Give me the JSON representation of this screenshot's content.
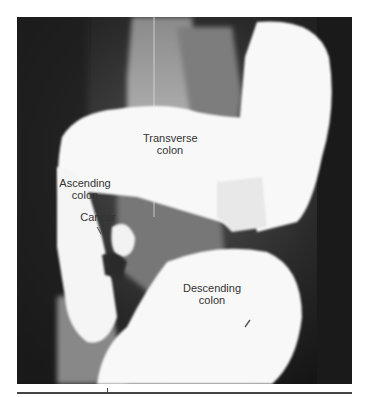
{
  "figure": {
    "type": "barium enema radiograph",
    "labels": [
      {
        "id": "transverse",
        "line1": "Transverse",
        "line2": "colon"
      },
      {
        "id": "ascending",
        "line1": "Ascending",
        "line2": "colon"
      },
      {
        "id": "cancer",
        "line1": "Cancer"
      },
      {
        "id": "descending",
        "line1": "Descending",
        "line2": "colon"
      }
    ],
    "colors": {
      "background_dark": "#1a1a1a",
      "barium_white": "#f8f8f8",
      "bone_gray": "#9a9a9a",
      "label_text": "#333333"
    }
  }
}
